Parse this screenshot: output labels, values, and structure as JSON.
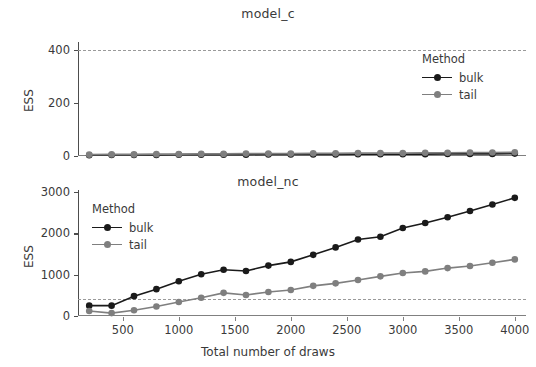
{
  "chart_data": {
    "type": "line",
    "title": "",
    "xlabel": "Total number of draws",
    "ylabel": "ESS",
    "xlim": [
      100,
      4100
    ],
    "xticks": [
      500,
      1000,
      1500,
      2000,
      2500,
      3000,
      3500,
      4000
    ],
    "legend": {
      "title": "Method",
      "entries": [
        {
          "name": "bulk",
          "color": "#1a1a1a"
        },
        {
          "name": "tail",
          "color": "#7f7f7f"
        }
      ]
    },
    "reference_line": {
      "value": 400,
      "style": "dashed",
      "color": "#9a9a9a"
    },
    "panels": [
      {
        "title": "model_c",
        "ylim": [
          0,
          430
        ],
        "yticks": [
          0,
          200,
          400
        ],
        "x": [
          200,
          400,
          600,
          800,
          1000,
          1200,
          1400,
          1600,
          1800,
          2000,
          2200,
          2400,
          2600,
          2800,
          3000,
          3200,
          3400,
          3600,
          3800,
          4000
        ],
        "series": [
          {
            "name": "bulk",
            "color": "#1a1a1a",
            "values": [
              3,
              4,
              4,
              4,
              5,
              5,
              5,
              5,
              6,
              6,
              6,
              6,
              7,
              7,
              7,
              7,
              8,
              8,
              8,
              9
            ]
          },
          {
            "name": "tail",
            "color": "#7f7f7f",
            "values": [
              5,
              6,
              6,
              7,
              7,
              8,
              8,
              9,
              9,
              9,
              10,
              10,
              11,
              11,
              11,
              12,
              12,
              13,
              13,
              14
            ]
          }
        ]
      },
      {
        "title": "model_nc",
        "ylim": [
          0,
          3050
        ],
        "yticks": [
          0,
          1000,
          2000,
          3000
        ],
        "x": [
          200,
          400,
          600,
          800,
          1000,
          1200,
          1400,
          1600,
          1800,
          2000,
          2200,
          2400,
          2600,
          2800,
          3000,
          3200,
          3400,
          3600,
          3800,
          4000
        ],
        "series": [
          {
            "name": "bulk",
            "color": "#1a1a1a",
            "values": [
              250,
              250,
              480,
              650,
              840,
              1010,
              1120,
              1090,
              1220,
              1310,
              1480,
              1660,
              1850,
              1920,
              2130,
              2250,
              2390,
              2540,
              2700,
              2860
            ]
          },
          {
            "name": "tail",
            "color": "#7f7f7f",
            "values": [
              120,
              70,
              140,
              230,
              340,
              440,
              560,
              510,
              580,
              630,
              730,
              790,
              870,
              960,
              1040,
              1080,
              1160,
              1210,
              1290,
              1370
            ]
          }
        ]
      }
    ]
  }
}
